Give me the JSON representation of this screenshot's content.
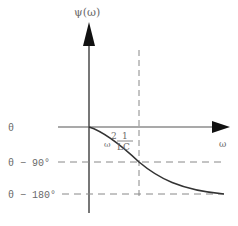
{
  "diagram": {
    "y_axis_label": "ψ(ω)",
    "x_axis_label": "ω",
    "levels": [
      {
        "label": "θ",
        "value_deg": 0
      },
      {
        "label": "θ − 90°",
        "value_deg": -90
      },
      {
        "label": "θ − 180°",
        "value_deg": -180
      }
    ],
    "marker_annotation": {
      "lhs": "ω",
      "exponent": "2",
      "numerator": "1",
      "denominator": "LC"
    },
    "colors": {
      "axis": "#555555",
      "curve": "#333333",
      "dashed": "#888888",
      "text": "#6a6a6a"
    }
  }
}
